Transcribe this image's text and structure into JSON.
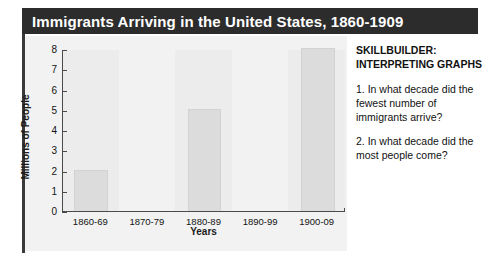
{
  "figure": {
    "title": "Immigrants Arriving in the United States, 1860-1909"
  },
  "skillbuilder": {
    "heading": "SKILLBUILDER: INTERPRETING GRAPHS",
    "questions": [
      "1. In what decade did the fewest number of immigrants arrive?",
      "2. In what decade did the most people come?"
    ]
  },
  "colors": {
    "title_bar": "#2c2c2c",
    "title_text": "#ffffff",
    "panel_background": "#f2f2f2",
    "bar_fill": "#dcdcdc",
    "axis": "#4a4a4a",
    "text": "#111111"
  },
  "chart_data": {
    "type": "bar",
    "title": "Immigrants Arriving in the United States, 1860-1909",
    "xlabel": "Years",
    "ylabel": "Millions of People",
    "categories": [
      "1860-69",
      "1870-79",
      "1880-89",
      "1890-99",
      "1900-09"
    ],
    "values": [
      2,
      0,
      5,
      0,
      8
    ],
    "ylim": [
      0,
      8
    ],
    "yticks": [
      0,
      1,
      2,
      3,
      4,
      5,
      6,
      7,
      8
    ],
    "ytick_labels": [
      "0",
      "1",
      "2",
      "3",
      "4",
      "5",
      "6",
      "7",
      "8"
    ],
    "grid": false,
    "legend": null
  }
}
